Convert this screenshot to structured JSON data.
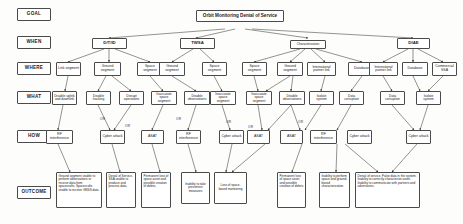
{
  "diagram": {
    "title": "Orbit Monitoring Denial of Service",
    "type": "attack-tree",
    "row_labels": [
      {
        "id": "goal",
        "label": "GOAL"
      },
      {
        "id": "when",
        "label": "WHEN"
      },
      {
        "id": "where",
        "label": "WHERE"
      },
      {
        "id": "what",
        "label": "WHAT"
      },
      {
        "id": "how",
        "label": "HOW"
      },
      {
        "id": "outcome",
        "label": "OUTCOME"
      }
    ],
    "when_nodes": [
      {
        "id": "w1",
        "label": "D/T/ID"
      },
      {
        "id": "w2",
        "label": "TWSA"
      },
      {
        "id": "w3",
        "label": "Characterization"
      },
      {
        "id": "w4",
        "label": "DIAE"
      }
    ],
    "where_nodes": [
      {
        "id": "p1",
        "label": "Link segment"
      },
      {
        "id": "p2",
        "label": "Ground segment"
      },
      {
        "id": "p3",
        "label": "Space segment"
      },
      {
        "id": "p4",
        "label": "Ground segment"
      },
      {
        "id": "p5",
        "label": "Space segment"
      },
      {
        "id": "p6",
        "label": "Space segment"
      },
      {
        "id": "p7",
        "label": "Ground segment"
      },
      {
        "id": "p8",
        "label": "International partner link"
      },
      {
        "id": "p9",
        "label": "Database"
      },
      {
        "id": "p10",
        "label": "International partner link"
      },
      {
        "id": "p11",
        "label": "Database"
      },
      {
        "id": "p12",
        "label": "Commercial SSA"
      }
    ],
    "what_nodes": [
      {
        "id": "a1",
        "label": "Disable uplink and downlink"
      },
      {
        "id": "a2",
        "label": "Disable tracking"
      },
      {
        "id": "a3",
        "label": "Disrupt operations"
      },
      {
        "id": "a4",
        "label": "Inaccurate space segment"
      },
      {
        "id": "a5",
        "label": "Disable observations"
      },
      {
        "id": "a6",
        "label": "Inaccurate space segment"
      },
      {
        "id": "a7",
        "label": "Inaccurate space segment"
      },
      {
        "id": "a8",
        "label": "Disable observations"
      },
      {
        "id": "a9",
        "label": "Isolate system"
      },
      {
        "id": "a10",
        "label": "Data corruption"
      },
      {
        "id": "a11",
        "label": "Data corruption"
      },
      {
        "id": "a12",
        "label": "Isolate system"
      }
    ],
    "how_nodes": [
      {
        "id": "h1",
        "label": "RF interference"
      },
      {
        "id": "h2",
        "label": "Cyber attack"
      },
      {
        "id": "h3",
        "label": "ASAT"
      },
      {
        "id": "h4",
        "label": "RF interference"
      },
      {
        "id": "h5",
        "label": "Cyber attack"
      },
      {
        "id": "h6",
        "label": "ASAT"
      },
      {
        "id": "h7",
        "label": "ASAT"
      },
      {
        "id": "h8",
        "label": "RF interference"
      },
      {
        "id": "h9",
        "label": "Cyber attack"
      },
      {
        "id": "h10",
        "label": "Cyber attack"
      }
    ],
    "gates": [
      {
        "id": "g1",
        "label": "OR"
      },
      {
        "id": "g2",
        "label": "OR"
      },
      {
        "id": "g3",
        "label": "OR"
      },
      {
        "id": "g4",
        "label": "OR"
      },
      {
        "id": "g5",
        "label": "OR"
      },
      {
        "id": "g6",
        "label": "OR"
      }
    ],
    "outcome_nodes": [
      {
        "id": "o1",
        "label": "Ground segment unable to perform observations or receive data from spacecrafts. Spacecrafts unable to receive GNSS data."
      },
      {
        "id": "o2",
        "label": "Denial of Service. SSA unable to produce and process data."
      },
      {
        "id": "o3",
        "label": "Permanent loss of space asset and possible creation of debris."
      },
      {
        "id": "o4",
        "label": "Inability to take preventive measures"
      },
      {
        "id": "o5",
        "label": "Loss of space-based monitoring"
      },
      {
        "id": "o6",
        "label": "Permanent loss of space asset and possible creation of debris"
      },
      {
        "id": "o7",
        "label": "Inability to perform space and ground-based characterization"
      },
      {
        "id": "o8",
        "label": "Denial of service. False data in the system. Inability to correctly characterize asset. Inability to communicate with partners and adversaries."
      }
    ],
    "colors": {
      "node_border": "#4a4a4a",
      "node_fill": "#ffffff",
      "edge": "#3a3a3a",
      "text": "#1b1b1b",
      "background": "#fdfdfb"
    }
  }
}
